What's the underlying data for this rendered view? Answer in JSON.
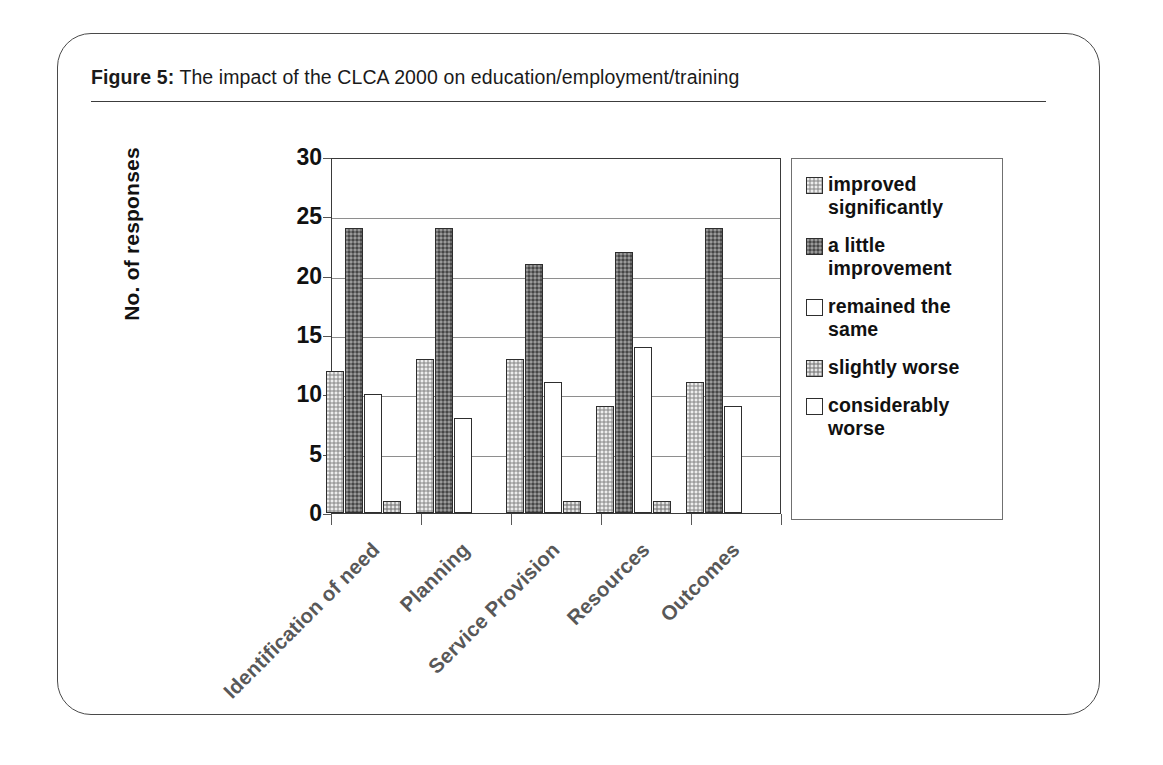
{
  "figure": {
    "label": "Figure 5:",
    "caption": " The impact of the CLCA 2000 on education/employment/training"
  },
  "chart_data": {
    "type": "bar",
    "title": "The impact of the CLCA 2000 on education/employment/training",
    "xlabel": "",
    "ylabel": "No. of responses",
    "ylim": [
      0,
      30
    ],
    "yticks": [
      0,
      5,
      10,
      15,
      20,
      25,
      30
    ],
    "grid": true,
    "legend_position": "right",
    "categories": [
      "Identification of need",
      "Planning",
      "Service Provision",
      "Resources",
      "Outcomes"
    ],
    "series": [
      {
        "name": "improved significantly",
        "color": "#b9b9b9",
        "values": [
          12,
          13,
          13,
          9,
          11
        ]
      },
      {
        "name": "a little improvement",
        "color": "#6e6e6e",
        "values": [
          24,
          24,
          21,
          22,
          24
        ]
      },
      {
        "name": "remained the same",
        "color": "#ffffff",
        "values": [
          10,
          8,
          11,
          14,
          9
        ]
      },
      {
        "name": "slightly worse",
        "color": "#ababab",
        "values": [
          1,
          0,
          1,
          1,
          0
        ]
      },
      {
        "name": "considerably worse",
        "color": "#ffffff",
        "values": [
          0,
          0,
          0,
          0,
          0
        ]
      }
    ]
  }
}
